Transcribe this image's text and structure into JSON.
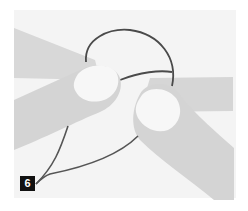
{
  "illustration": {
    "subject": "knot-tying-step",
    "step_number": "6",
    "colors": {
      "background": "#ffffff",
      "panel": "#f4f4f4",
      "finger": "#d6d6d6",
      "fingernail": "#f7f7f7",
      "cord": "#4a4a4a",
      "badge_bg": "#111111",
      "badge_text": "#ffffff"
    }
  }
}
